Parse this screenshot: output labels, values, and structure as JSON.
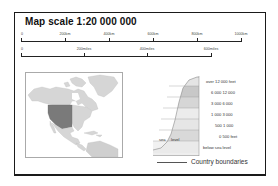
{
  "title": "Map scale  1:20 000 000",
  "scale_km": {
    "labels": [
      "0",
      "200km",
      "400km",
      "600km",
      "800km",
      "1000km"
    ],
    "positions_px": [
      0,
      44,
      88,
      132,
      176,
      220
    ]
  },
  "scale_miles": {
    "labels": [
      "0",
      "200miles",
      "400miles",
      "600miles"
    ],
    "positions_px": [
      0,
      63,
      126,
      190
    ]
  },
  "map": {
    "region": "North America",
    "highlighted": "United States (western)",
    "colors": {
      "land": "#d6d6d6",
      "highlight": "#7a7a7a",
      "water": "#ffffff",
      "border": "#aaaaaa"
    }
  },
  "elevation_legend": {
    "bands": [
      {
        "label": "over 12 000 feet",
        "color": "#e4e4e4"
      },
      {
        "label": "6 000  12 000",
        "color": "#c8c8c8"
      },
      {
        "label": "3 000  6 000",
        "color": "#d6d6d6"
      },
      {
        "label": "1 000  3 000",
        "color": "#ececec"
      },
      {
        "label": "500  1 000",
        "color": "#e6e6e6"
      },
      {
        "label": "0   500 feet",
        "color": "#d9d9d9"
      },
      {
        "label": "below sea level",
        "color": "#eeeeee"
      }
    ],
    "sea_label": "sea",
    "level_label": "level"
  },
  "boundary_legend": {
    "label": "Country boundaries"
  }
}
